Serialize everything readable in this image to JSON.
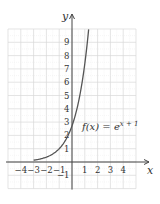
{
  "chart_data": {
    "type": "line",
    "title": "",
    "xlabel": "x",
    "ylabel": "y",
    "xlim": [
      -5,
      5
    ],
    "ylim": [
      -2,
      10
    ],
    "grid": true,
    "x_ticks": [
      -4,
      -3,
      -2,
      -1,
      1,
      2,
      3,
      4
    ],
    "x_tick_labels": [
      "−4",
      "−3",
      "−2",
      "−1",
      "1",
      "2",
      "3",
      "4"
    ],
    "y_ticks": [
      -1,
      1,
      2,
      3,
      4,
      5,
      6,
      7,
      8,
      9
    ],
    "y_tick_labels": [
      "−1",
      "1",
      "2",
      "3",
      "4",
      "5",
      "6",
      "7",
      "8",
      "9"
    ],
    "series": [
      {
        "name": "f(x) = e^(x+1)",
        "function": "exp(x+1)",
        "x": [
          -3,
          -2.5,
          -2,
          -1.5,
          -1,
          -0.5,
          0,
          0.5,
          1,
          1.3
        ],
        "values": [
          0.135,
          0.223,
          0.368,
          0.607,
          1.0,
          1.649,
          2.718,
          4.482,
          7.389,
          9.974
        ]
      }
    ],
    "annotations": [
      {
        "text_main": "f(x) = e",
        "text_sup": "x + 1",
        "x": 0.5,
        "y": 2.6
      }
    ],
    "colors": {
      "curve": "#555555",
      "grid": "#d8d8d8",
      "axis": "#444444"
    }
  }
}
